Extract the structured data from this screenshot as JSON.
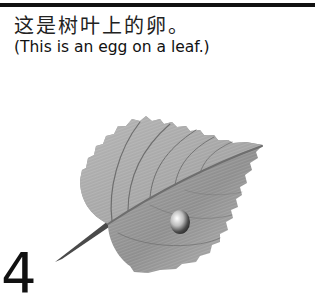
{
  "page": {
    "caption_chinese": "这是树叶上的卵。",
    "caption_english": "(This is an egg on a leaf.)",
    "page_number": "4"
  },
  "illustration": {
    "subject": "leaf-with-egg",
    "leaf_color": "#a0a0a0",
    "vein_color": "#6e6e6e",
    "egg_color": "#bbbbbb"
  }
}
